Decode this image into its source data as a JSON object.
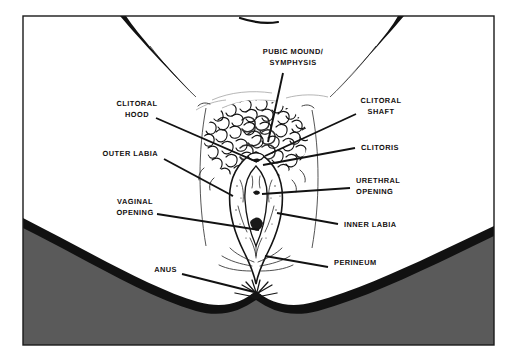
{
  "figure": {
    "style": "line-art illustration",
    "frame": {
      "border_color": "#1a1a1a",
      "background_color": "#ffffff",
      "shadow_color": "#5a5a5a",
      "outline_color": "#111111"
    }
  },
  "labels": [
    {
      "id": "pubic-mound-symphysis",
      "lines": [
        "PUBIC MOUND/",
        "SYMPHYSIS"
      ],
      "side": "top",
      "text_x": 293,
      "text_y": 54,
      "anchor": "middle",
      "leader": {
        "x1": 283,
        "y1": 73,
        "x2": 268,
        "y2": 142
      }
    },
    {
      "id": "clitoral-hood",
      "lines": [
        "CLITORAL",
        "HOOD"
      ],
      "side": "left",
      "text_x": 137,
      "text_y": 106,
      "anchor": "middle",
      "leader": {
        "x1": 156,
        "y1": 118,
        "x2": 257,
        "y2": 162
      }
    },
    {
      "id": "outer-labia",
      "lines": [
        "OUTER LABIA"
      ],
      "side": "left",
      "text_x": 158,
      "text_y": 156,
      "anchor": "end",
      "leader": {
        "x1": 164,
        "y1": 159,
        "x2": 233,
        "y2": 196
      }
    },
    {
      "id": "vaginal-opening",
      "lines": [
        "VAGINAL",
        "OPENING"
      ],
      "side": "left",
      "text_x": 135,
      "text_y": 204,
      "anchor": "middle",
      "leader": {
        "x1": 157,
        "y1": 214,
        "x2": 259,
        "y2": 230
      }
    },
    {
      "id": "anus",
      "lines": [
        "ANUS"
      ],
      "side": "left",
      "text_x": 177,
      "text_y": 272,
      "anchor": "end",
      "leader": {
        "x1": 182,
        "y1": 274,
        "x2": 254,
        "y2": 292
      }
    },
    {
      "id": "clitoral-shaft",
      "lines": [
        "CLITORAL",
        "SHAFT"
      ],
      "side": "right",
      "text_x": 381,
      "text_y": 103,
      "anchor": "middle",
      "leader": {
        "x1": 356,
        "y1": 114,
        "x2": 265,
        "y2": 156
      }
    },
    {
      "id": "clitoris",
      "lines": [
        "CLITORIS"
      ],
      "side": "right",
      "text_x": 361,
      "text_y": 150,
      "anchor": "start",
      "leader": {
        "x1": 355,
        "y1": 148,
        "x2": 263,
        "y2": 165
      }
    },
    {
      "id": "urethral-opening",
      "lines": [
        "URETHRAL",
        "OPENING"
      ],
      "side": "right",
      "text_x": 356,
      "text_y": 183,
      "anchor": "start",
      "leader": {
        "x1": 350,
        "y1": 188,
        "x2": 262,
        "y2": 194
      }
    },
    {
      "id": "inner-labia",
      "lines": [
        "INNER LABIA"
      ],
      "side": "right",
      "text_x": 344,
      "text_y": 227,
      "anchor": "start",
      "leader": {
        "x1": 338,
        "y1": 224,
        "x2": 277,
        "y2": 213
      }
    },
    {
      "id": "perineum",
      "lines": [
        "PERINEUM"
      ],
      "side": "right",
      "text_x": 334,
      "text_y": 265,
      "anchor": "start",
      "leader": {
        "x1": 328,
        "y1": 267,
        "x2": 265,
        "y2": 256
      }
    }
  ]
}
